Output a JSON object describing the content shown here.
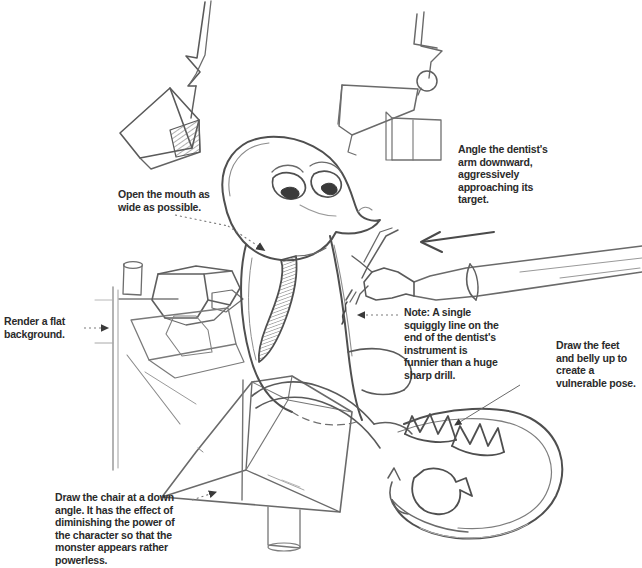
{
  "page": {
    "kind": "pencil-sketch-storyboard",
    "background_color": "#ffffff",
    "ink_color": "#4a4a4a",
    "text_color": "#2b2b2b",
    "width": 642,
    "height": 568
  },
  "annotations": [
    {
      "id": "open-mouth",
      "text": "Open the mouth as wide as possible.",
      "leader": "dotted-line-with-solid-arrowhead",
      "points_to": "monster-mouth"
    },
    {
      "id": "angle-arm",
      "text": "Angle the dentist's arm downward, aggressively approaching its target.",
      "leader": "drawn-arrow",
      "points_to": "dentist-arm"
    },
    {
      "id": "render-background",
      "text": "Render a flat background.",
      "leader": "dotted-line-with-solid-arrowhead",
      "points_to": "background-wall"
    },
    {
      "id": "instrument-note",
      "text": "Note: A single squiggly line on the end of the dentist's instrument is funnier than a huge sharp drill.",
      "leader": "dotted-line-with-solid-arrowhead",
      "points_to": "dental-instrument-tip"
    },
    {
      "id": "feet-belly",
      "text": "Draw the feet and belly up to create a vulnerable pose.",
      "leader": "thin-arrow",
      "points_to": "monster-feet"
    },
    {
      "id": "chair-angle",
      "text": "Draw the chair at a down angle. It has the effect of diminishing the power of the character so that the monster appears rather powerless.",
      "leader": "dotted-line-with-solid-arrowhead",
      "points_to": "dentist-chair"
    }
  ],
  "artwork_elements": [
    {
      "id": "hanging-lamp",
      "label": "overhead exam lamp on jointed arm, upper left"
    },
    {
      "id": "lamp-arm-joint",
      "label": "articulated lamp arm with round hinge, upper right"
    },
    {
      "id": "monster-head",
      "label": "round monster head with two worried eyes"
    },
    {
      "id": "monster-mouth",
      "label": "wide open shaded mouth"
    },
    {
      "id": "monster-neck",
      "label": "long tapering neck"
    },
    {
      "id": "monster-belly",
      "label": "rounded belly raised up"
    },
    {
      "id": "monster-feet",
      "label": "clawed feet with toes pointing up"
    },
    {
      "id": "monster-tail",
      "label": "curved crescent tail"
    },
    {
      "id": "dentist-arm",
      "label": "dentist's forearm entering from right edge"
    },
    {
      "id": "dental-instrument",
      "label": "instrument with single squiggly line at tip"
    },
    {
      "id": "dentist-chair",
      "label": "reclined dentist chair seen at down angle"
    },
    {
      "id": "background-wall",
      "label": "flat background wall panel at left"
    }
  ]
}
